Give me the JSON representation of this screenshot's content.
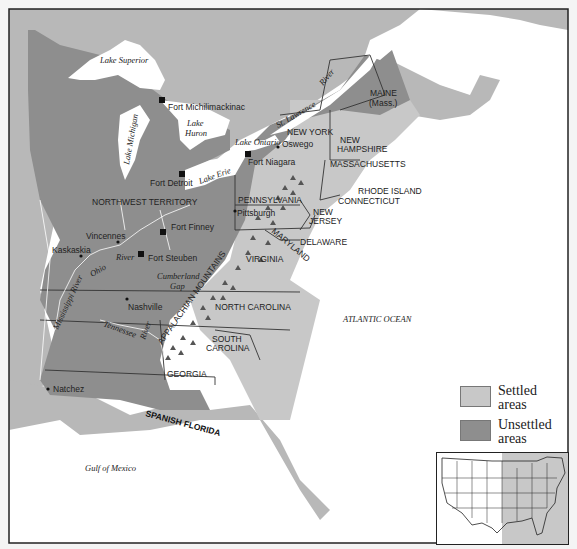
{
  "map": {
    "colors": {
      "settled": "#c8c8c8",
      "unsettled": "#8e8e8e",
      "water": "#ffffff",
      "other_land": "#b8b8b8",
      "border": "#333333",
      "frame": "#222222"
    },
    "water_labels": {
      "lake_superior": "Lake Superior",
      "lake_michigan": "Lake Michigan",
      "lake_huron_1": "Lake",
      "lake_huron_2": "Huron",
      "lake_ontario": "Lake Ontario",
      "lake_erie": "Lake Erie",
      "st_lawrence_1": "St. Lawrence",
      "st_lawrence_2": "River",
      "ohio_river": "Ohio",
      "mississippi_river": "Mississippi River",
      "tennessee_river": "Tennessee",
      "river_generic": "River",
      "knox_river": "River",
      "atlantic": "ATLANTIC OCEAN",
      "gulf": "Gulf of Mexico",
      "cumberland_1": "Cumberland",
      "cumberland_2": "Gap"
    },
    "region_labels": {
      "maine_1": "MAINE",
      "maine_2": "(Mass.)",
      "new_york": "NEW YORK",
      "new_hampshire_1": "NEW",
      "new_hampshire_2": "HAMPSHIRE",
      "massachusetts": "MASSACHUSETTS",
      "rhode_island": "RHODE ISLAND",
      "connecticut": "CONNECTICUT",
      "pennsylvania": "PENNSYLVANIA",
      "new_jersey_1": "NEW",
      "new_jersey_2": "JERSEY",
      "delaware": "DELAWARE",
      "maryland": "MARYLAND",
      "virginia": "VIRGINIA",
      "north_carolina": "NORTH CAROLINA",
      "south_carolina_1": "SOUTH",
      "south_carolina_2": "CAROLINA",
      "georgia": "GEORGIA",
      "northwest_territory": "NORTHWEST TERRITORY",
      "spanish_florida": "SPANISH FLORIDA",
      "appalachian": "APPALACHIAN MOUNTAINS"
    },
    "places": [
      {
        "name": "Fort Michilimackinac",
        "type": "fort"
      },
      {
        "name": "Fort Detroit",
        "type": "fort"
      },
      {
        "name": "Fort Niagara",
        "type": "fort"
      },
      {
        "name": "Oswego",
        "type": "town"
      },
      {
        "name": "Fort Finney",
        "type": "fort"
      },
      {
        "name": "Fort Steuben",
        "type": "fort"
      },
      {
        "name": "Vincennes",
        "type": "town"
      },
      {
        "name": "Kaskaskia",
        "type": "town"
      },
      {
        "name": "Pittsburgh",
        "type": "town"
      },
      {
        "name": "Nashville",
        "type": "town"
      },
      {
        "name": "Natchez",
        "type": "town"
      }
    ]
  },
  "legend": {
    "items": [
      {
        "label_1": "Settled",
        "label_2": "areas",
        "color": "#c8c8c8"
      },
      {
        "label_1": "Unsettled",
        "label_2": "areas",
        "color": "#8e8e8e"
      }
    ]
  },
  "inset": {
    "title": "United States locator map",
    "highlight_color": "#c8c8c8"
  }
}
